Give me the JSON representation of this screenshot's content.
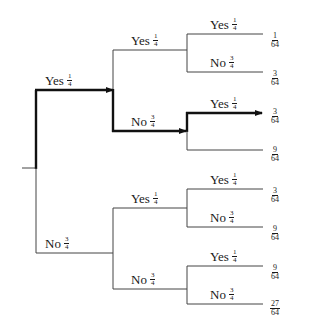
{
  "diagram": {
    "type": "probability-tree",
    "colors": {
      "line": "#444444",
      "highlight": "#111111",
      "background": "#ffffff"
    },
    "branches": {
      "L1_yes": {
        "word": "Yes",
        "num": "1",
        "den": "4"
      },
      "L1_no": {
        "word": "No",
        "num": "3",
        "den": "4"
      },
      "L2_yes_yes": {
        "word": "Yes",
        "num": "1",
        "den": "4"
      },
      "L2_yes_no": {
        "word": "No",
        "num": "3",
        "den": "4"
      },
      "L2_no_yes": {
        "word": "Yes",
        "num": "1",
        "den": "4"
      },
      "L2_no_no": {
        "word": "No",
        "num": "3",
        "den": "4"
      },
      "L3": [
        {
          "word": "Yes",
          "num": "1",
          "den": "4"
        },
        {
          "word": "No",
          "num": "3",
          "den": "4"
        },
        {
          "word": "Yes",
          "num": "1",
          "den": "4"
        },
        {
          "word": "No",
          "num": "3",
          "den": "4"
        },
        {
          "word": "Yes",
          "num": "1",
          "den": "4"
        },
        {
          "word": "No",
          "num": "3",
          "den": "4"
        },
        {
          "word": "Yes",
          "num": "1",
          "den": "4"
        },
        {
          "word": "No",
          "num": "3",
          "den": "4"
        }
      ]
    },
    "outcomes": [
      {
        "num": "1",
        "den": "64"
      },
      {
        "num": "3",
        "den": "64"
      },
      {
        "num": "3",
        "den": "64"
      },
      {
        "num": "9",
        "den": "64"
      },
      {
        "num": "3",
        "den": "64"
      },
      {
        "num": "9",
        "den": "64"
      },
      {
        "num": "9",
        "den": "64"
      },
      {
        "num": "27",
        "den": "64"
      }
    ],
    "highlighted_path": [
      "Yes",
      "No",
      "Yes"
    ]
  }
}
